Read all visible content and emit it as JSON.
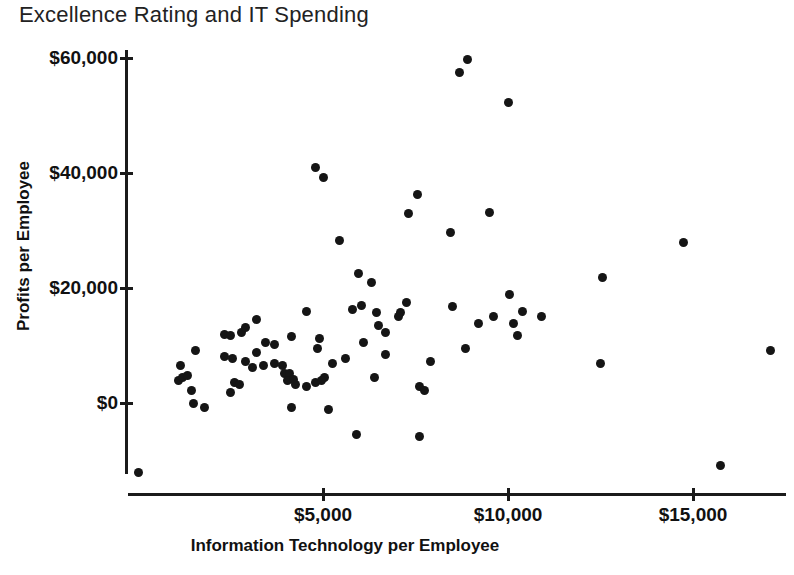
{
  "title": "Excellence Rating and IT Spending",
  "colors": {
    "background": "#ffffff",
    "axis": "#1b1b1b",
    "marker": "#151515",
    "text": "#111111",
    "title_text": "#222222"
  },
  "chart_data": {
    "type": "scatter",
    "title": "Excellence Rating and IT Spending",
    "xlabel": "Information Technology per Employee",
    "ylabel": "Profits per Employee",
    "legend": "none",
    "grid": false,
    "xlim": [
      -300,
      17700
    ],
    "ylim": [
      -16000,
      62000
    ],
    "marker": {
      "shape": "circle",
      "color": "#151515",
      "diameter_px": 9
    },
    "x_ticks": [
      {
        "value": 5000,
        "label": "$5,000"
      },
      {
        "value": 10000,
        "label": "$10,000"
      },
      {
        "value": 15000,
        "label": "$15,000"
      }
    ],
    "y_ticks": [
      {
        "value": 0,
        "label": "$0"
      },
      {
        "value": 20000,
        "label": "$20,000"
      },
      {
        "value": 40000,
        "label": "$40,000"
      },
      {
        "value": 60000,
        "label": "$60,000"
      }
    ],
    "points": [
      [
        8900,
        59800
      ],
      [
        8700,
        57400
      ],
      [
        10000,
        52300
      ],
      [
        4800,
        41000
      ],
      [
        5000,
        39300
      ],
      [
        7550,
        36200
      ],
      [
        7300,
        32900
      ],
      [
        9500,
        33200
      ],
      [
        8450,
        29600
      ],
      [
        5450,
        28200
      ],
      [
        14750,
        28000
      ],
      [
        12550,
        21900
      ],
      [
        5950,
        22600
      ],
      [
        6300,
        20900
      ],
      [
        10050,
        18800
      ],
      [
        4550,
        16000
      ],
      [
        5800,
        16200
      ],
      [
        6050,
        16900
      ],
      [
        6450,
        15800
      ],
      [
        7250,
        17400
      ],
      [
        7100,
        15800
      ],
      [
        7050,
        15100
      ],
      [
        8500,
        16700
      ],
      [
        9200,
        13900
      ],
      [
        9600,
        15000
      ],
      [
        10400,
        16000
      ],
      [
        10150,
        13900
      ],
      [
        10250,
        11800
      ],
      [
        10900,
        15000
      ],
      [
        17100,
        9200
      ],
      [
        12500,
        6800
      ],
      [
        3200,
        14600
      ],
      [
        2350,
        12000
      ],
      [
        2500,
        11800
      ],
      [
        2800,
        12300
      ],
      [
        2900,
        13200
      ],
      [
        4150,
        11500
      ],
      [
        4900,
        11300
      ],
      [
        4850,
        9550
      ],
      [
        1550,
        9050
      ],
      [
        6500,
        13400
      ],
      [
        6700,
        12200
      ],
      [
        6100,
        10450
      ],
      [
        6700,
        8500
      ],
      [
        5600,
        7800
      ],
      [
        5250,
        6800
      ],
      [
        5050,
        4350
      ],
      [
        8850,
        9550
      ],
      [
        7900,
        7300
      ],
      [
        3450,
        10600
      ],
      [
        3700,
        10250
      ],
      [
        3200,
        8850
      ],
      [
        2350,
        8150
      ],
      [
        2550,
        7800
      ],
      [
        2900,
        7300
      ],
      [
        3100,
        6250
      ],
      [
        3400,
        6450
      ],
      [
        3700,
        6950
      ],
      [
        3900,
        6600
      ],
      [
        1150,
        6450
      ],
      [
        1100,
        3850
      ],
      [
        1200,
        4350
      ],
      [
        1350,
        4850
      ],
      [
        1450,
        2100
      ],
      [
        1500,
        0
      ],
      [
        1800,
        -850
      ],
      [
        2600,
        3500
      ],
      [
        2750,
        3300
      ],
      [
        2500,
        1900
      ],
      [
        3950,
        5050
      ],
      [
        4100,
        5200
      ],
      [
        4050,
        4000
      ],
      [
        4200,
        4150
      ],
      [
        4250,
        3300
      ],
      [
        4550,
        2800
      ],
      [
        4800,
        3500
      ],
      [
        4950,
        3850
      ],
      [
        6400,
        4350
      ],
      [
        7600,
        2800
      ],
      [
        7750,
        2250
      ],
      [
        4150,
        -700
      ],
      [
        5150,
        -1050
      ],
      [
        5900,
        -5550
      ],
      [
        7600,
        -5750
      ],
      [
        15750,
        -10950
      ],
      [
        0,
        -12000
      ]
    ]
  }
}
